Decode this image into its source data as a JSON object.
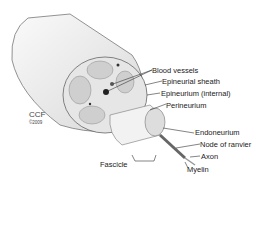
{
  "diagram": {
    "credit": {
      "org": "CCF",
      "copyright": "©2009"
    },
    "labels": {
      "blood_vessels": "Blood vessels",
      "epineurial_sheath": "Epineurial sheath",
      "epineurium_internal": "Epineurium (internal)",
      "perineurium": "Perineurium",
      "endoneurium": "Endoneurium",
      "node_of_ranvier": "Node of ranvier",
      "axon": "Axon",
      "myelin": "Myelin",
      "fascicle": "Fascicle"
    }
  }
}
